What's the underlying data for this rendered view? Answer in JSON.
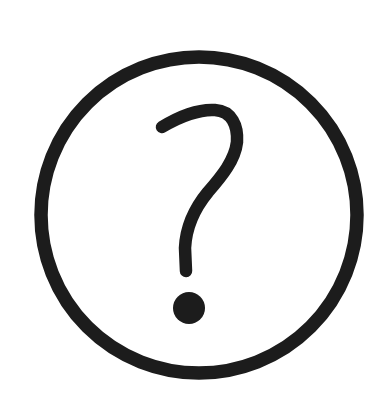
{
  "icon": {
    "name": "help-circle",
    "label": "?",
    "colors": {
      "stroke": "#1c1c1c",
      "background": "#ffffff"
    }
  }
}
